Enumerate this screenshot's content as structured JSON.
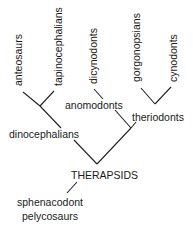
{
  "diagram": {
    "type": "cladogram",
    "root": {
      "label": "THERAPSIDS",
      "outgroup": [
        "sphenacodont",
        "pelycosaurs"
      ]
    },
    "clades": [
      {
        "label": "dinocephalians",
        "taxa": [
          "anteosaurs",
          "tapinocephalians"
        ]
      },
      {
        "label": "anomodonts",
        "taxa": [
          "dicynodonts"
        ]
      },
      {
        "label": "theriodonts",
        "taxa": [
          "gorgonopsians",
          "cynodonts"
        ]
      }
    ],
    "labels": {
      "anteosaurs": "anteosaurs",
      "tapinocephalians": "tapinocephalians",
      "dicynodonts": "dicynodonts",
      "gorgonopsians": "gorgonopsians",
      "cynodonts": "cynodonts",
      "anomodonts": "anomodonts",
      "theriodonts": "theriodonts",
      "dinocephalians": "dinocephalians",
      "therapsids": "THERAPSIDS",
      "outgroup_line1": "sphenacodont",
      "outgroup_line2": "pelycosaurs"
    }
  }
}
